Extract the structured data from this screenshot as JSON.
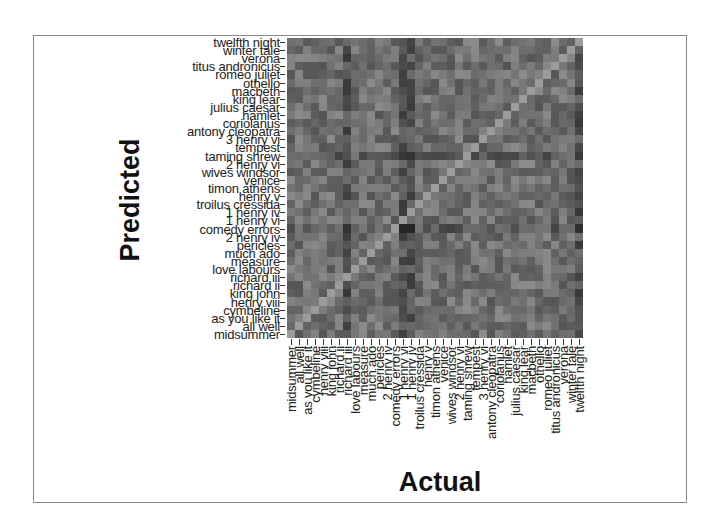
{
  "chart_data": {
    "type": "heatmap",
    "title": "",
    "xlabel": "Actual",
    "ylabel": "Predicted",
    "x_categories": [
      "midsummer",
      "all well",
      "as you like it",
      "cymbeline",
      "henry viii",
      "king john",
      "richard ii",
      "richard iii",
      "love labours",
      "measure",
      "much ado",
      "pericles",
      "2 henry iv",
      "comedy errors",
      "1 henry vi",
      "1 henry iv",
      "troilus cressida",
      "henry v",
      "timon athens",
      "venice",
      "wives windsor",
      "2 henry vi",
      "taming shrew",
      "tempest",
      "3 henry vi",
      "antony cleopatra",
      "coriolanus",
      "hamlet",
      "julius caesar",
      "king lear",
      "macbeth",
      "othello",
      "romeo juliet",
      "titus andronicus",
      "verona",
      "winter tale",
      "twelfth night"
    ],
    "y_categories": [
      "twelfth night",
      "winter tale",
      "verona",
      "titus andronicus",
      "romeo juliet",
      "othello",
      "macbeth",
      "king lear",
      "julius caesar",
      "hamlet",
      "coriolanus",
      "antony cleopatra",
      "3 henry vi",
      "tempest",
      "taming shrew",
      "2 henry vi",
      "wives windsor",
      "venice",
      "timon athens",
      "henry v",
      "troilus cressida",
      "1 henry iv",
      "1 henry vi",
      "comedy errors",
      "2 henry iv",
      "pericles",
      "much ado",
      "measure",
      "love labours",
      "richard iii",
      "richard ii",
      "king john",
      "henry viii",
      "cymbeline",
      "as you like it",
      "all well",
      "midsummer"
    ],
    "value_scale": "grayscale brightness, lighter = higher similarity; diagonal is lightest",
    "colormap": {
      "low": "#2a2a2a",
      "high": "#a8a8a8"
    },
    "dark_columns": [
      "richard iii",
      "1 henry vi",
      "1 henry iv",
      "twelfth night"
    ],
    "dark_rows": [
      "comedy errors",
      "taming shrew"
    ],
    "grid": false,
    "legend": "none"
  }
}
